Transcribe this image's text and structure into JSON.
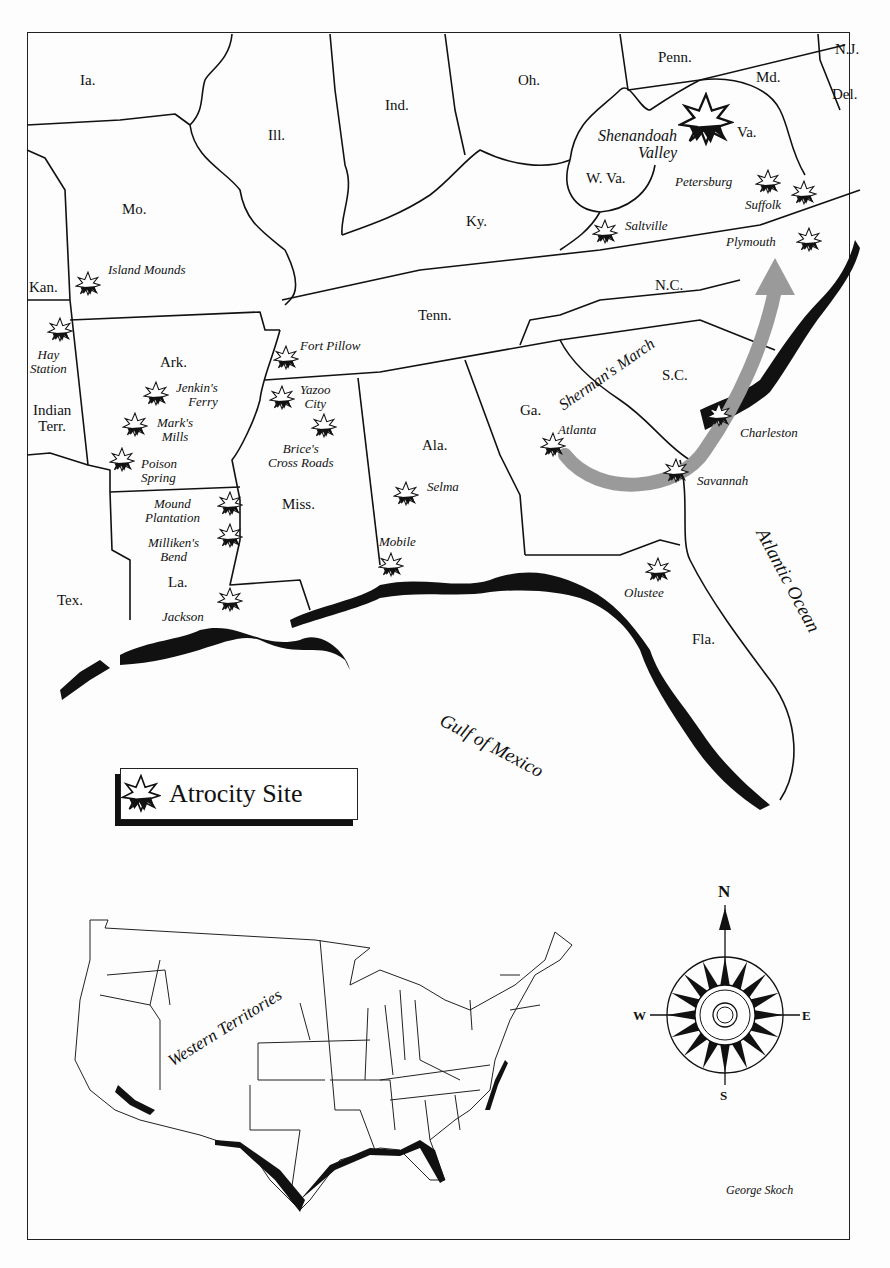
{
  "map": {
    "credit": "George Skoch",
    "legend": {
      "label": "Atrocity Site",
      "icon": "starburst-icon"
    },
    "states": [
      {
        "id": "ia",
        "label": "Ia.",
        "x": 80,
        "y": 73
      },
      {
        "id": "ill",
        "label": "Ill.",
        "x": 268,
        "y": 128
      },
      {
        "id": "ind",
        "label": "Ind.",
        "x": 385,
        "y": 98
      },
      {
        "id": "oh",
        "label": "Oh.",
        "x": 518,
        "y": 73
      },
      {
        "id": "penn",
        "label": "Penn.",
        "x": 658,
        "y": 50
      },
      {
        "id": "nj",
        "label": "N.J.",
        "x": 835,
        "y": 42
      },
      {
        "id": "md",
        "label": "Md.",
        "x": 756,
        "y": 70
      },
      {
        "id": "del",
        "label": "Del.",
        "x": 832,
        "y": 87
      },
      {
        "id": "va",
        "label": "Va.",
        "x": 737,
        "y": 125
      },
      {
        "id": "wva",
        "label": "W. Va.",
        "x": 586,
        "y": 171
      },
      {
        "id": "mo",
        "label": "Mo.",
        "x": 122,
        "y": 202
      },
      {
        "id": "ky",
        "label": "Ky.",
        "x": 466,
        "y": 214
      },
      {
        "id": "kan",
        "label": "Kan.",
        "x": 29,
        "y": 280
      },
      {
        "id": "nc",
        "label": "N.C.",
        "x": 655,
        "y": 278
      },
      {
        "id": "tenn",
        "label": "Tenn.",
        "x": 418,
        "y": 308
      },
      {
        "id": "ark",
        "label": "Ark.",
        "x": 160,
        "y": 355
      },
      {
        "id": "sc",
        "label": "S.C.",
        "x": 662,
        "y": 368
      },
      {
        "id": "indian-terr",
        "label": "Indian\nTerr.",
        "x": 33,
        "y": 403
      },
      {
        "id": "ga",
        "label": "Ga.",
        "x": 520,
        "y": 403
      },
      {
        "id": "ala",
        "label": "Ala.",
        "x": 422,
        "y": 438
      },
      {
        "id": "miss",
        "label": "Miss.",
        "x": 282,
        "y": 497
      },
      {
        "id": "la",
        "label": "La.",
        "x": 168,
        "y": 575
      },
      {
        "id": "tex",
        "label": "Tex.",
        "x": 57,
        "y": 593
      },
      {
        "id": "fla",
        "label": "Fla.",
        "x": 692,
        "y": 632
      }
    ],
    "sites": [
      {
        "id": "shenandoah",
        "label": "Shenandoah\nValley",
        "lx": 598,
        "ly": 128,
        "align": "right",
        "sx": 706,
        "sy": 120,
        "big": true
      },
      {
        "id": "petersburg",
        "label": "Petersburg",
        "lx": 675,
        "ly": 175,
        "align": "left",
        "sx": 768,
        "sy": 182
      },
      {
        "id": "suffolk",
        "label": "Suffolk",
        "lx": 745,
        "ly": 198,
        "align": "left",
        "sx": 804,
        "sy": 193
      },
      {
        "id": "saltville",
        "label": "Saltville",
        "lx": 625,
        "ly": 219,
        "align": "left",
        "sx": 605,
        "sy": 232
      },
      {
        "id": "plymouth",
        "label": "Plymouth",
        "lx": 726,
        "ly": 235,
        "align": "left",
        "sx": 809,
        "sy": 240
      },
      {
        "id": "island-mounds",
        "label": "Island Mounds",
        "lx": 108,
        "ly": 263,
        "align": "left",
        "sx": 88,
        "sy": 284
      },
      {
        "id": "hay-station",
        "label": "Hay\nStation",
        "lx": 30,
        "ly": 348,
        "align": "center",
        "sx": 60,
        "sy": 330
      },
      {
        "id": "fort-pillow",
        "label": "Fort Pillow",
        "lx": 300,
        "ly": 339,
        "align": "left",
        "sx": 286,
        "sy": 358
      },
      {
        "id": "jenkins-ferry",
        "label": "Jenkin's\nFerry",
        "lx": 176,
        "ly": 381,
        "align": "right",
        "sx": 156,
        "sy": 394
      },
      {
        "id": "yazoo-city",
        "label": "Yazoo\nCity",
        "lx": 300,
        "ly": 383,
        "align": "center",
        "sx": 282,
        "sy": 398
      },
      {
        "id": "marks-mills",
        "label": "Mark's\nMills",
        "lx": 157,
        "ly": 416,
        "align": "center",
        "sx": 135,
        "sy": 425
      },
      {
        "id": "brices-cross-roads",
        "label": "Brice's\nCross Roads",
        "lx": 268,
        "ly": 442,
        "align": "center",
        "sx": 324,
        "sy": 426
      },
      {
        "id": "atlanta",
        "label": "Atlanta",
        "lx": 558,
        "ly": 423,
        "align": "left",
        "sx": 553,
        "sy": 445
      },
      {
        "id": "charleston",
        "label": "Charleston",
        "lx": 740,
        "ly": 426,
        "align": "left",
        "sx": 719,
        "sy": 415
      },
      {
        "id": "poison-spring",
        "label": "Poison\nSpring",
        "lx": 141,
        "ly": 457,
        "align": "left",
        "sx": 122,
        "sy": 460
      },
      {
        "id": "savannah",
        "label": "Savannah",
        "lx": 697,
        "ly": 474,
        "align": "left",
        "sx": 676,
        "sy": 471
      },
      {
        "id": "selma",
        "label": "Selma",
        "lx": 427,
        "ly": 480,
        "align": "left",
        "sx": 406,
        "sy": 494
      },
      {
        "id": "mound-plantation",
        "label": "Mound\nPlantation",
        "lx": 145,
        "ly": 497,
        "align": "center",
        "sx": 230,
        "sy": 504
      },
      {
        "id": "millikens-bend",
        "label": "Milliken's\nBend",
        "lx": 148,
        "ly": 536,
        "align": "center",
        "sx": 230,
        "sy": 536
      },
      {
        "id": "mobile",
        "label": "Mobile",
        "lx": 379,
        "ly": 535,
        "align": "left",
        "sx": 391,
        "sy": 565
      },
      {
        "id": "olustee",
        "label": "Olustee",
        "lx": 624,
        "ly": 586,
        "align": "left",
        "sx": 658,
        "sy": 570
      },
      {
        "id": "jackson",
        "label": "Jackson",
        "lx": 162,
        "ly": 610,
        "align": "left",
        "sx": 230,
        "sy": 600
      }
    ],
    "annotations": [
      {
        "id": "shermans-march",
        "label": "Sherman's March"
      }
    ],
    "water": [
      {
        "id": "gulf-of-mexico",
        "label": "Gulf of Mexico"
      },
      {
        "id": "atlantic-ocean",
        "label": "Atlantic Ocean"
      }
    ],
    "inset": {
      "label": "Western Territories"
    },
    "compass": {
      "n": "N",
      "s": "S",
      "e": "E",
      "w": "W"
    }
  }
}
